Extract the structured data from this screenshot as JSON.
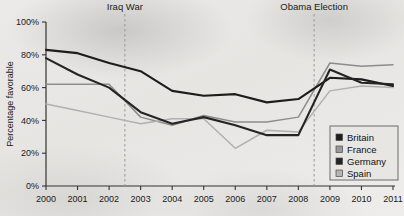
{
  "chart_data": {
    "type": "line",
    "title": "",
    "xlabel": "",
    "ylabel": "Percentage favorable",
    "x": [
      2000,
      2001,
      2002,
      2003,
      2004,
      2005,
      2006,
      2007,
      2008,
      2009,
      2010,
      2011
    ],
    "xtick_labels": [
      "2000",
      "2001",
      "2002",
      "2003",
      "2004",
      "2005",
      "2006",
      "2007",
      "2008",
      "2009",
      "2010",
      "2011"
    ],
    "ytick_labels": [
      "0%",
      "20%",
      "40%",
      "60%",
      "80%",
      "100%"
    ],
    "ytick_values": [
      0,
      20,
      40,
      60,
      80,
      100
    ],
    "ylim": [
      0,
      100
    ],
    "xlim": [
      2000,
      2011
    ],
    "grid": false,
    "legend_position": "bottom-right",
    "series": [
      {
        "name": "Britain",
        "color": "#1c1c1c",
        "swatch": "#1c1c1c",
        "values": [
          83,
          81,
          75,
          70,
          58,
          55,
          56,
          51,
          53,
          66,
          65,
          61
        ]
      },
      {
        "name": "France",
        "color": "#8d8d8d",
        "swatch": "#9a9a9a",
        "values": [
          62,
          62,
          62,
          42,
          37,
          43,
          39,
          39,
          42,
          75,
          73,
          74
        ]
      },
      {
        "name": "Germany",
        "color": "#242424",
        "swatch": "#242424",
        "values": [
          78,
          68,
          60,
          45,
          38,
          42,
          37,
          31,
          31,
          71,
          63,
          62
        ]
      },
      {
        "name": "Spain",
        "color": "#b0b0b0",
        "swatch": "#b5b5b5",
        "values": [
          50,
          46,
          42,
          38,
          41,
          41,
          23,
          34,
          33,
          58,
          61,
          60
        ]
      }
    ],
    "annotations": [
      {
        "label": "Iraq War",
        "x": 2002.5
      },
      {
        "label": "Obama Election",
        "x": 2008.5
      }
    ]
  }
}
